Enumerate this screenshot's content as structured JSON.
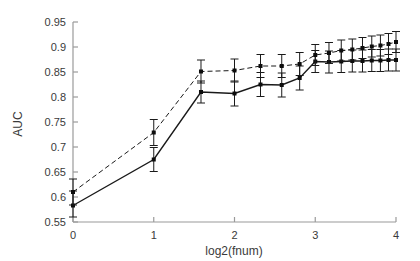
{
  "chart_data": {
    "type": "line",
    "title": "",
    "xlabel": "log2(fnum)",
    "ylabel": "AUC",
    "xlim": [
      0,
      4
    ],
    "ylim": [
      0.55,
      0.95
    ],
    "xticks": [
      0,
      1,
      2,
      3,
      4
    ],
    "xtick_labels": [
      "0",
      "1",
      "2",
      "3",
      "4"
    ],
    "yticks": [
      0.55,
      0.6,
      0.65,
      0.7,
      0.75,
      0.8,
      0.85,
      0.9,
      0.95
    ],
    "ytick_labels": [
      "0.55",
      "0.6",
      "0.65",
      "0.7",
      "0.75",
      "0.8",
      "0.85",
      "0.9",
      "0.95"
    ],
    "grid": false,
    "legend": "none",
    "errorbars": true,
    "x": [
      0,
      1,
      1.585,
      2,
      2.322,
      2.585,
      2.807,
      3,
      3.17,
      3.322,
      3.459,
      3.585,
      3.7,
      3.807,
      3.907,
      4
    ],
    "series": [
      {
        "name": "solid",
        "linestyle": "solid",
        "color": "#1a1a1a",
        "marker": "square",
        "values": [
          0.583,
          0.675,
          0.81,
          0.807,
          0.825,
          0.824,
          0.838,
          0.871,
          0.87,
          0.871,
          0.872,
          0.872,
          0.873,
          0.873,
          0.874,
          0.874
        ],
        "err_lower": [
          0.023,
          0.024,
          0.022,
          0.025,
          0.024,
          0.024,
          0.024,
          0.022,
          0.022,
          0.022,
          0.022,
          0.022,
          0.022,
          0.022,
          0.022,
          0.022
        ],
        "err_upper": [
          0.029,
          0.024,
          0.022,
          0.025,
          0.024,
          0.024,
          0.024,
          0.022,
          0.022,
          0.022,
          0.022,
          0.022,
          0.022,
          0.022,
          0.022,
          0.022
        ]
      },
      {
        "name": "dashed",
        "linestyle": "dashed",
        "color": "#1a1a1a",
        "marker": "square",
        "values": [
          0.61,
          0.729,
          0.851,
          0.853,
          0.862,
          0.862,
          0.866,
          0.884,
          0.888,
          0.893,
          0.895,
          0.898,
          0.901,
          0.903,
          0.906,
          0.91
        ],
        "err_lower": [
          0.026,
          0.026,
          0.023,
          0.023,
          0.023,
          0.023,
          0.023,
          0.021,
          0.021,
          0.021,
          0.021,
          0.021,
          0.021,
          0.021,
          0.021,
          0.021
        ],
        "err_upper": [
          0.026,
          0.026,
          0.023,
          0.023,
          0.023,
          0.023,
          0.023,
          0.021,
          0.021,
          0.021,
          0.021,
          0.021,
          0.021,
          0.021,
          0.021,
          0.021
        ]
      }
    ]
  }
}
